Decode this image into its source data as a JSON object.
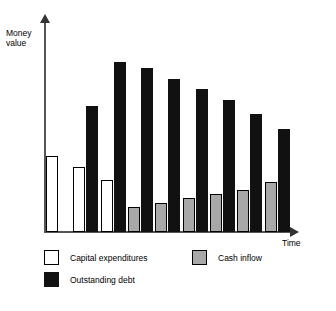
{
  "chart_data": {
    "type": "bar",
    "title": "",
    "subtitle": "",
    "xlabel": "Time",
    "ylabel": "Money\nvalue",
    "grid": false,
    "legend_position": "below",
    "axis_arrows": true,
    "categories": [
      "1",
      "2",
      "3",
      "4",
      "5",
      "6",
      "7",
      "8",
      "9"
    ],
    "ylim": [
      0,
      100
    ],
    "xlim_note": "Unlabeled ordinal time periods; axes have no tick labels",
    "series": [
      {
        "name": "Capital expenditures",
        "color": "#ffffff",
        "edge_color": "#000000",
        "values": [
          36,
          31,
          25,
          0,
          0,
          0,
          0,
          0,
          0
        ]
      },
      {
        "name": "Cash inflow",
        "color": "#a8a8a8",
        "edge_color": "#000000",
        "values": [
          0,
          0,
          0,
          12,
          14,
          16,
          18,
          20,
          24
        ]
      },
      {
        "name": "Outstanding debt",
        "color": "#111111",
        "edge_color": "#111111",
        "values": [
          0,
          60,
          81,
          78,
          73,
          68,
          63,
          56,
          49
        ]
      }
    ]
  },
  "axes": {
    "y_title": "Money\nvalue",
    "x_title": "Time"
  },
  "legend": {
    "items": [
      {
        "label": "Capital expenditures",
        "swatch": "white-square-swatch"
      },
      {
        "label": "Cash inflow",
        "swatch": "gray-square-swatch"
      },
      {
        "label": "Outstanding debt",
        "swatch": "black-square-swatch"
      }
    ]
  }
}
